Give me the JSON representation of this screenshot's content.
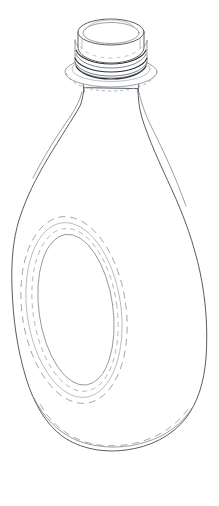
{
  "image": {
    "kind": "technical-line-drawing",
    "subject": "plastic bottle",
    "view": "three-quarter perspective",
    "width_px": 219,
    "height_px": 506,
    "background_color": "#ffffff",
    "line_color_primary": "#555c63",
    "line_color_secondary": "#8d949b",
    "line_color_faint": "#aab0b6",
    "line_color_thread": "#2b2f33",
    "alt_text": "Outline drawing of a bottle with a threaded neck finish, tapered shoulder and a recessed oval label panel on the front face"
  },
  "parts": [
    {
      "id": "cap-top",
      "label": "Cap top ellipse",
      "description": "Elliptical top opening of the closure seen in perspective",
      "bbox": [
        78,
        17,
        146,
        52
      ]
    },
    {
      "id": "cap-rim",
      "label": "Cap outer rim",
      "description": "Second concentric ellipse forming the rim wall of the closure",
      "bbox": [
        74,
        20,
        150,
        60
      ]
    },
    {
      "id": "neck-threads",
      "label": "Neck thread bands",
      "description": "Three dark helical thread turns wrapping the finish",
      "count": 3,
      "bbox": [
        72,
        48,
        152,
        78
      ]
    },
    {
      "id": "support-flange",
      "label": "Support flange",
      "description": "Wide elliptical collar below the threads",
      "bbox": [
        65,
        60,
        158,
        90
      ]
    },
    {
      "id": "neck",
      "label": "Neck",
      "description": "Short cylindrical neck between the flange and the shoulder",
      "bbox": [
        82,
        84,
        140,
        104
      ]
    },
    {
      "id": "shoulder",
      "label": "Shoulder",
      "description": "Tapered shoulder flaring from the neck out to the body",
      "bbox": [
        13,
        95,
        206,
        285
      ]
    },
    {
      "id": "body",
      "label": "Body",
      "description": "Asymmetric rounded body, widest near the lower third",
      "bbox": [
        12,
        230,
        207,
        452
      ]
    },
    {
      "id": "label-panel",
      "label": "Recessed oval label panel",
      "description": "Concentric dashed ellipses marking a sunken oval panel on the front face",
      "ring_count": 4,
      "bbox": [
        22,
        216,
        126,
        404
      ]
    },
    {
      "id": "base",
      "label": "Base seam",
      "description": "Double contour line at the bottom showing the heel and standing surface",
      "bbox": [
        30,
        418,
        200,
        452
      ]
    }
  ],
  "annotations": {
    "caption": "",
    "figure_number": "",
    "reference_numerals": []
  }
}
